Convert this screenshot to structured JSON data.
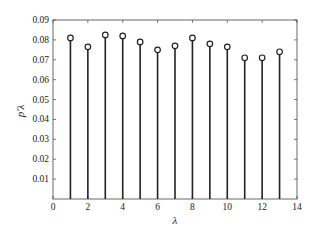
{
  "chart_data": {
    "type": "stem",
    "title": "",
    "xlabel": "λ",
    "ylabel": "p'λ",
    "xlim": [
      0,
      14
    ],
    "ylim": [
      0,
      0.09
    ],
    "x_ticks": [
      "0",
      "2",
      "4",
      "6",
      "8",
      "10",
      "12",
      "14"
    ],
    "y_ticks": [
      "0.01",
      "0.02",
      "0.03",
      "0.04",
      "0.05",
      "0.06",
      "0.07",
      "0.08",
      "0.09"
    ],
    "grid": false,
    "legend": null,
    "x": [
      1,
      2,
      3,
      4,
      5,
      6,
      7,
      8,
      9,
      10,
      11,
      12,
      13
    ],
    "values": [
      0.081,
      0.0765,
      0.0825,
      0.082,
      0.079,
      0.075,
      0.077,
      0.081,
      0.078,
      0.0765,
      0.071,
      0.071,
      0.074
    ]
  },
  "colors": {
    "stem": "#222222",
    "axis": "#444444"
  }
}
